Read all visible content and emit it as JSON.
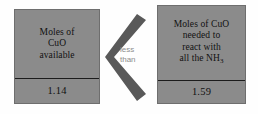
{
  "diagram": {
    "colors": {
      "box_fill": "#8b8b8b",
      "box_border": "#6e6e6e",
      "divider": "#1c1c1c",
      "arrow": "#595959",
      "caption_text": "#8d8d8d",
      "background": "#fefefe",
      "box_text": "#111111"
    },
    "left_box": {
      "label_lines": [
        "Moles of",
        "CuO",
        "available"
      ],
      "value": "1.14"
    },
    "right_box": {
      "label_lines": [
        "Moles of CuO",
        "needed to",
        "react with",
        "all the NH"
      ],
      "formula_subscript": "3",
      "value": "1.59"
    },
    "comparator": {
      "symbol": "<",
      "icon": "less-than-chevron-icon",
      "caption_lines": [
        "less",
        "than"
      ]
    }
  }
}
